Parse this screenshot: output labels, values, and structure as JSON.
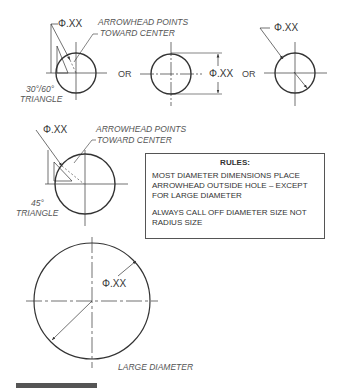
{
  "figure": {
    "top_row": {
      "example1": {
        "dimension": "Φ.XX",
        "note_line1": "ARROWHEAD POINTS",
        "note_line2": "TOWARD CENTER",
        "triangle_line1": "30°/60°",
        "triangle_line2": "TRIANGLE"
      },
      "or1": "OR",
      "example2": {
        "dimension": "Φ.XX"
      },
      "or2": "OR",
      "example3": {
        "dimension": "Φ.XX"
      }
    },
    "middle_row": {
      "dimension": "Φ.XX",
      "note_line1": "ARROWHEAD POINTS",
      "note_line2": "TOWARD CENTER",
      "triangle_line1": "45°",
      "triangle_line2": "TRIANGLE"
    },
    "rules": {
      "title": "RULES:",
      "rule1": "MOST DIAMETER DIMENSIONS PLACE ARROWHEAD OUTSIDE HOLE – EXCEPT FOR LARGE DIAMETER",
      "rule2": "ALWAYS CALL OFF DIAMETER SIZE NOT RADIUS SIZE"
    },
    "large": {
      "dimension": "Φ.XX",
      "caption": "LARGE DIAMETER"
    }
  }
}
